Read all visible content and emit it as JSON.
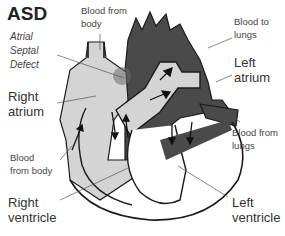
{
  "title": "ASD",
  "subtitle_lines": [
    "Atrial",
    "Septal",
    "Defect"
  ],
  "labels": {
    "blood_from_body_top": [
      "Blood from",
      "body"
    ],
    "blood_to_lungs": [
      "Blood to",
      "lungs"
    ],
    "left_atrium": [
      "Left",
      "atrium"
    ],
    "right_atrium": [
      "Right",
      "atrium"
    ],
    "blood_from_lungs": [
      "Blood from",
      "lungs"
    ],
    "blood_from_body_bottom": [
      "Blood",
      "from body"
    ],
    "right_ventricle": [
      "Right",
      "ventricle"
    ],
    "left_ventricle": [
      "Left",
      "ventricle"
    ]
  },
  "colors": {
    "deoxygenated": "#d4d4d4",
    "oxygenated": "#4a4a4a",
    "outline": "#1a1a1a",
    "defect_shadow": "#6b6b6b"
  }
}
